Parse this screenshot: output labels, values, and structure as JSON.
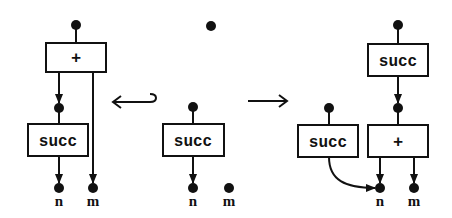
{
  "diagram": {
    "colors": {
      "ink": "#111111",
      "background": "#ffffff"
    },
    "left_graph": {
      "plus_box": {
        "label": "+"
      },
      "succ_box": {
        "label": "succ"
      },
      "outputs": [
        {
          "label": "n"
        },
        {
          "label": "m"
        }
      ]
    },
    "left_arrow": {
      "symbol": "hook-left-arrow"
    },
    "middle_graph": {
      "lone_node": {},
      "succ_box": {
        "label": "succ"
      },
      "outputs": [
        {
          "label": "n"
        },
        {
          "label": "m"
        }
      ]
    },
    "right_arrow": {
      "symbol": "right-arrow"
    },
    "right_graph": {
      "top_succ_box": {
        "label": "succ"
      },
      "lower_succ_box": {
        "label": "succ"
      },
      "plus_box": {
        "label": "+"
      },
      "outputs": [
        {
          "label": "n"
        },
        {
          "label": "m"
        }
      ]
    }
  }
}
